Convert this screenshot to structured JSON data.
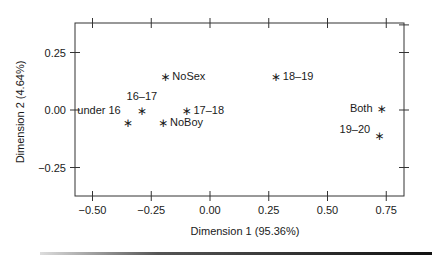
{
  "chart_data": {
    "type": "scatter",
    "title": "",
    "xlabel": "Dimension 1 (95.36%)",
    "ylabel": "Dimension 2 (4.64%)",
    "xlim": [
      -0.58,
      0.82
    ],
    "ylim": [
      -0.38,
      0.38
    ],
    "xticks": [
      -0.5,
      -0.25,
      0.0,
      0.25,
      0.5,
      0.75
    ],
    "xtick_labels": [
      "−0.50",
      "−0.25",
      "0.00",
      "0.25",
      "0.50",
      "0.75"
    ],
    "yticks": [
      0.25,
      0.0,
      -0.25
    ],
    "ytick_labels": [
      "0.25",
      "0.00",
      "−0.25"
    ],
    "grid": false,
    "legend": null,
    "marker": "*",
    "points": [
      {
        "label": "NoSex",
        "x": -0.19,
        "y": 0.15,
        "label_pos": "right"
      },
      {
        "label": "16–17",
        "x": -0.29,
        "y": 0.0,
        "label_pos": "above"
      },
      {
        "label": "under 16",
        "x": -0.35,
        "y": -0.05,
        "label_pos": "upper-left"
      },
      {
        "label": "NoBoy",
        "x": -0.2,
        "y": -0.05,
        "label_pos": "right"
      },
      {
        "label": "17–18",
        "x": -0.1,
        "y": 0.0,
        "label_pos": "right"
      },
      {
        "label": "18–19",
        "x": 0.28,
        "y": 0.15,
        "label_pos": "right"
      },
      {
        "label": "Both",
        "x": 0.73,
        "y": 0.01,
        "label_pos": "left"
      },
      {
        "label": "19–20",
        "x": 0.72,
        "y": -0.11,
        "label_pos": "left"
      }
    ]
  }
}
